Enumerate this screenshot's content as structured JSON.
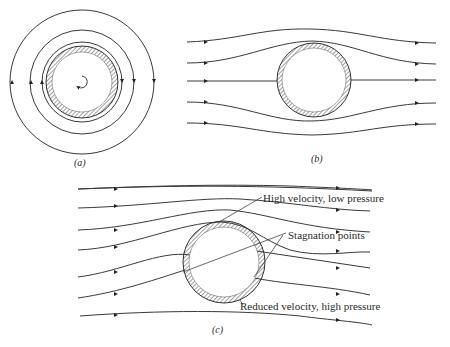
{
  "figure": {
    "panels": [
      {
        "id": "a",
        "caption": "(a)",
        "description": "Circulation around a rotating cylinder: concentric streamlines with a rotation arrow"
      },
      {
        "id": "b",
        "caption": "(b)",
        "description": "Uniform flow past a stationary cylinder: symmetric streamlines"
      },
      {
        "id": "c",
        "caption": "(c)",
        "description": "Combined flow (uniform flow + circulation) past a rotating cylinder"
      }
    ],
    "annotations": {
      "high_velocity": "High velocity, low pressure",
      "stagnation": "Stagnation points",
      "reduced_velocity": "Reduced velocity, high pressure"
    },
    "colors": {
      "stroke": "#3a3a3a",
      "background": "#ffffff"
    }
  }
}
